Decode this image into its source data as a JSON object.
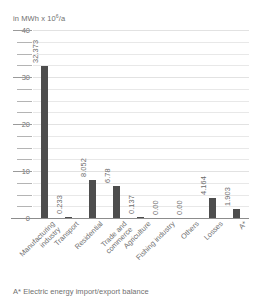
{
  "chart_data": {
    "type": "bar",
    "title": "",
    "subtitle": "",
    "unit_caption": "in MWh x 10",
    "unit_exponent": "6",
    "unit_suffix": "/a",
    "xlabel": "",
    "ylabel": "in MWh x 10^6/a",
    "ylim": [
      0,
      40
    ],
    "grid": true,
    "legend": "none",
    "y_major_ticks": [
      "40",
      "30",
      "20",
      "10",
      "0"
    ],
    "y_major_values": [
      40,
      30,
      20,
      10,
      0
    ],
    "y_minor_values": [
      37.5,
      35,
      32.5,
      27.5,
      25,
      22.5,
      17.5,
      15,
      12.5,
      7.5,
      5,
      2.5
    ],
    "categories": [
      "Manufacturing industry",
      "Transport",
      "Residential",
      "Trade and commerce",
      "Agriculture",
      "Fishing industry",
      "Others",
      "Losses",
      "A*"
    ],
    "values": [
      32.373,
      0.233,
      8.052,
      6.78,
      0.137,
      0.0,
      0.0,
      4.164,
      1.903
    ],
    "value_labels": [
      "32.373",
      "0.233",
      "8.052",
      "6.78",
      "0.137",
      "0.00",
      "0.00",
      "4.164",
      "1.903"
    ],
    "bar_color": "#4d4d4d",
    "grid_color": "#e8e8e8",
    "text_color": "#6f6f6f"
  },
  "category_lines": [
    [
      "Manufacturing",
      "industry"
    ],
    [
      "Transport",
      ""
    ],
    [
      "Residential",
      ""
    ],
    [
      "Trade and",
      "commerce"
    ],
    [
      "Agriculture",
      ""
    ],
    [
      "Fishing industry",
      ""
    ],
    [
      "Others",
      ""
    ],
    [
      "Losses",
      ""
    ],
    [
      "A*",
      ""
    ]
  ],
  "footnote": "A* Electric energy import/export balance"
}
